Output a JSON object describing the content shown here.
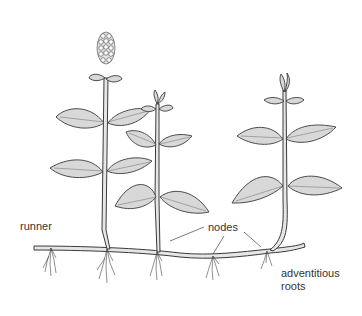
{
  "diagram": {
    "style": "pencil line drawing",
    "colors": {
      "background": "#ffffff",
      "ink": "#3a3a3a",
      "leaf_fill": "#d8d8d8"
    },
    "plants": [
      {
        "id": "plant-1",
        "has_flower_spike": true,
        "leaf_pairs": 3
      },
      {
        "id": "plant-2",
        "has_bud": true,
        "leaf_pairs": 3
      },
      {
        "id": "plant-3",
        "has_bud": true,
        "leaf_pairs": 3
      }
    ],
    "labels": {
      "runner": "runner",
      "nodes": "nodes",
      "adventitious_roots_line1": "adventitious",
      "adventitious_roots_line2": "roots"
    }
  }
}
